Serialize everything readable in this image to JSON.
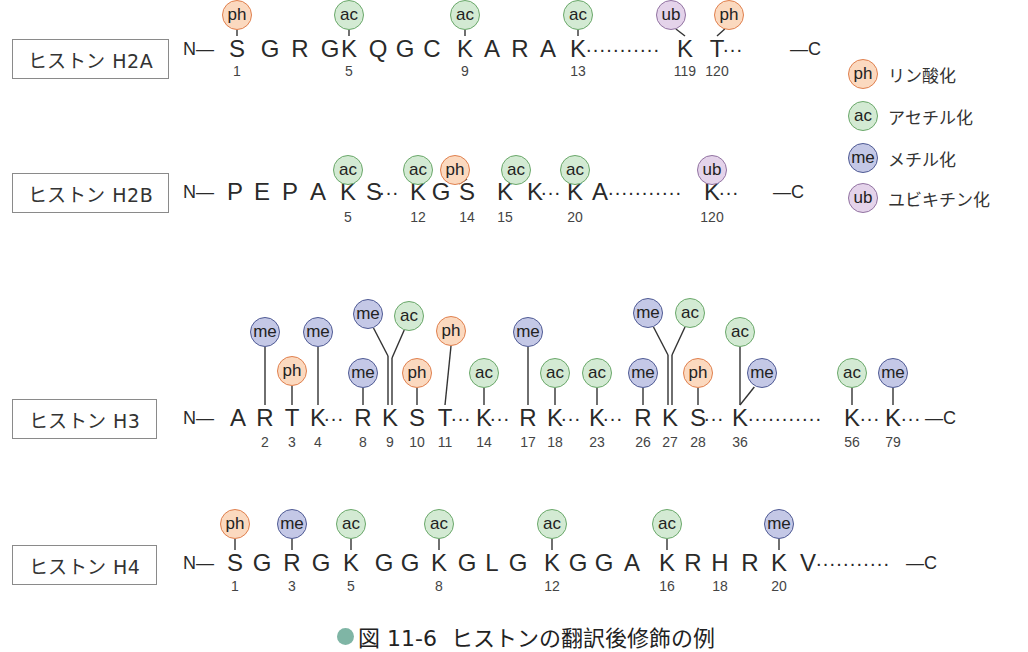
{
  "figure": {
    "caption_number": "図 11-6",
    "caption_text": "ヒストンの翻訳後修飾の例",
    "colors": {
      "ph": {
        "fill": "#fbd9bf",
        "stroke": "#e0804e"
      },
      "ac": {
        "fill": "#d3ead3",
        "stroke": "#6aa86a"
      },
      "me": {
        "fill": "#c4c8e6",
        "stroke": "#4f5a94"
      },
      "ub": {
        "fill": "#e4d3ea",
        "stroke": "#9273a2"
      },
      "caption_bullet": "#7fb5a5"
    }
  },
  "legend": [
    {
      "code": "ph",
      "label": "リン酸化"
    },
    {
      "code": "ac",
      "label": "アセチル化"
    },
    {
      "code": "me",
      "label": "メチル化"
    },
    {
      "code": "ub",
      "label": "ユビキチン化"
    }
  ],
  "histones": [
    {
      "name": "ヒストン H2A",
      "n_term": "N—",
      "c_term": "—C",
      "sequence": [
        {
          "aa": "S",
          "pos": "1"
        },
        {
          "aa": "G"
        },
        {
          "aa": "R"
        },
        {
          "aa": "G"
        },
        {
          "aa": "K",
          "pos": "5"
        },
        {
          "aa": "Q"
        },
        {
          "aa": "G"
        },
        {
          "aa": "C"
        },
        {
          "aa": "K",
          "pos": "9"
        },
        {
          "aa": "A"
        },
        {
          "aa": "R"
        },
        {
          "aa": "A"
        },
        {
          "aa": "K",
          "pos": "13"
        },
        {
          "gap": "..........."
        },
        {
          "aa": "K",
          "pos": "119"
        },
        {
          "aa": "T",
          "pos": "120"
        },
        {
          "gap": "..."
        }
      ],
      "modifications": [
        {
          "pos": "1",
          "type": "ph"
        },
        {
          "pos": "5",
          "type": "ac"
        },
        {
          "pos": "9",
          "type": "ac"
        },
        {
          "pos": "13",
          "type": "ac"
        },
        {
          "pos": "119",
          "type": "ub"
        },
        {
          "pos": "120",
          "type": "ph"
        }
      ]
    },
    {
      "name": "ヒストン H2B",
      "n_term": "N—",
      "c_term": "—C",
      "sequence": [
        {
          "aa": "P"
        },
        {
          "aa": "E"
        },
        {
          "aa": "P"
        },
        {
          "aa": "A"
        },
        {
          "aa": "K",
          "pos": "5"
        },
        {
          "aa": "S"
        },
        {
          "gap": "..."
        },
        {
          "aa": "K",
          "pos": "12"
        },
        {
          "aa": "G"
        },
        {
          "aa": "S",
          "pos": "14"
        },
        {
          "aa": "K",
          "pos": "15"
        },
        {
          "aa": "K"
        },
        {
          "gap": "..."
        },
        {
          "aa": "K",
          "pos": "20"
        },
        {
          "aa": "A"
        },
        {
          "gap": "..........."
        },
        {
          "aa": "K",
          "pos": "120"
        },
        {
          "gap": "..."
        }
      ],
      "modifications": [
        {
          "pos": "5",
          "type": "ac"
        },
        {
          "pos": "12",
          "type": "ac"
        },
        {
          "pos": "14",
          "type": "ph"
        },
        {
          "pos": "15",
          "type": "ac"
        },
        {
          "pos": "20",
          "type": "ac"
        },
        {
          "pos": "120",
          "type": "ub"
        }
      ]
    },
    {
      "name": "ヒストン H3",
      "n_term": "N—",
      "c_term": "—C",
      "sequence": [
        {
          "aa": "A"
        },
        {
          "aa": "R",
          "pos": "2"
        },
        {
          "aa": "T",
          "pos": "3"
        },
        {
          "aa": "K",
          "pos": "4"
        },
        {
          "gap": "..."
        },
        {
          "aa": "R",
          "pos": "8"
        },
        {
          "aa": "K",
          "pos": "9"
        },
        {
          "aa": "S",
          "pos": "10"
        },
        {
          "aa": "T",
          "pos": "11"
        },
        {
          "gap": "..."
        },
        {
          "aa": "K",
          "pos": "14"
        },
        {
          "gap": "..."
        },
        {
          "aa": "R",
          "pos": "17"
        },
        {
          "aa": "K",
          "pos": "18"
        },
        {
          "gap": "..."
        },
        {
          "aa": "K",
          "pos": "23"
        },
        {
          "gap": "..."
        },
        {
          "aa": "R",
          "pos": "26"
        },
        {
          "aa": "K",
          "pos": "27"
        },
        {
          "aa": "S",
          "pos": "28"
        },
        {
          "gap": "..."
        },
        {
          "aa": "K",
          "pos": "36"
        },
        {
          "gap": "..........."
        },
        {
          "aa": "K",
          "pos": "56"
        },
        {
          "gap": "..."
        },
        {
          "aa": "K",
          "pos": "79"
        },
        {
          "gap": "..."
        }
      ],
      "modifications": [
        {
          "pos": "2",
          "type": "me"
        },
        {
          "pos": "3",
          "type": "ph"
        },
        {
          "pos": "4",
          "type": "me"
        },
        {
          "pos": "8",
          "type": "me"
        },
        {
          "pos": "9",
          "type": "me"
        },
        {
          "pos": "9",
          "type": "ac"
        },
        {
          "pos": "10",
          "type": "ph"
        },
        {
          "pos": "11",
          "type": "ph"
        },
        {
          "pos": "14",
          "type": "ac"
        },
        {
          "pos": "17",
          "type": "me"
        },
        {
          "pos": "18",
          "type": "ac"
        },
        {
          "pos": "23",
          "type": "ac"
        },
        {
          "pos": "26",
          "type": "me"
        },
        {
          "pos": "27",
          "type": "me"
        },
        {
          "pos": "27",
          "type": "ac"
        },
        {
          "pos": "28",
          "type": "ph"
        },
        {
          "pos": "36",
          "type": "ac"
        },
        {
          "pos": "36",
          "type": "me"
        },
        {
          "pos": "56",
          "type": "ac"
        },
        {
          "pos": "79",
          "type": "me"
        }
      ]
    },
    {
      "name": "ヒストン H4",
      "n_term": "N—",
      "c_term": "—C",
      "sequence": [
        {
          "aa": "S",
          "pos": "1"
        },
        {
          "aa": "G"
        },
        {
          "aa": "R",
          "pos": "3"
        },
        {
          "aa": "G"
        },
        {
          "aa": "K",
          "pos": "5"
        },
        {
          "aa": "G"
        },
        {
          "aa": "G"
        },
        {
          "aa": "K",
          "pos": "8"
        },
        {
          "aa": "G"
        },
        {
          "aa": "L"
        },
        {
          "aa": "G"
        },
        {
          "aa": "K",
          "pos": "12"
        },
        {
          "aa": "G"
        },
        {
          "aa": "G"
        },
        {
          "aa": "A"
        },
        {
          "aa": "K",
          "pos": "16"
        },
        {
          "aa": "R"
        },
        {
          "aa": "H",
          "pos": "18"
        },
        {
          "aa": "R"
        },
        {
          "aa": "K",
          "pos": "20"
        },
        {
          "aa": "V"
        },
        {
          "gap": "..........."
        }
      ],
      "modifications": [
        {
          "pos": "1",
          "type": "ph"
        },
        {
          "pos": "3",
          "type": "me"
        },
        {
          "pos": "5",
          "type": "ac"
        },
        {
          "pos": "8",
          "type": "ac"
        },
        {
          "pos": "12",
          "type": "ac"
        },
        {
          "pos": "16",
          "type": "ac"
        },
        {
          "pos": "20",
          "type": "me"
        }
      ]
    }
  ]
}
